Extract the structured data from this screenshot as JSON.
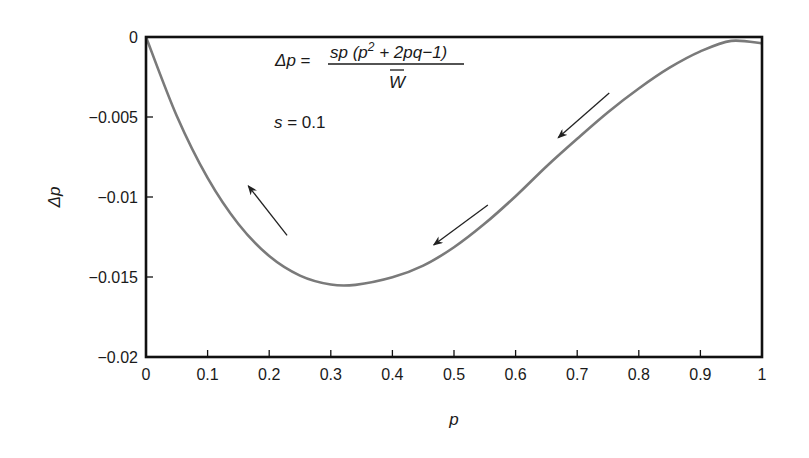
{
  "chart_data": {
    "type": "line",
    "title": "",
    "xlabel": "p",
    "ylabel": "Δp",
    "xlim": [
      0,
      1
    ],
    "ylim": [
      -0.02,
      0
    ],
    "grid": false,
    "x_ticks": [
      "0",
      "0.1",
      "0.2",
      "0.3",
      "0.4",
      "0.5",
      "0.6",
      "0.7",
      "0.8",
      "0.9",
      "1"
    ],
    "y_ticks": [
      "0",
      "−0.005",
      "−0.01",
      "−0.015",
      "−0.02"
    ],
    "series": [
      {
        "name": "Δp",
        "x": [
          0,
          0.05,
          0.1,
          0.15,
          0.2,
          0.25,
          0.3,
          0.34,
          0.4,
          0.45,
          0.5,
          0.55,
          0.6,
          0.65,
          0.7,
          0.75,
          0.8,
          0.85,
          0.9,
          0.95,
          1.0
        ],
        "y": [
          0,
          -0.00494,
          -0.00881,
          -0.01169,
          -0.01369,
          -0.01491,
          -0.01547,
          -0.01549,
          -0.01502,
          -0.01429,
          -0.01314,
          -0.01166,
          -0.00995,
          -0.00809,
          -0.00636,
          -0.0047,
          -0.00322,
          -0.00192,
          -0.0009,
          -0.00024,
          -0.0004
        ]
      }
    ],
    "annotations": {
      "equation_lhs": "Δp =",
      "equation_numerator": "sp (p² + 2pq−1)",
      "equation_denominator": "W̄",
      "parameter": "s = 0.1",
      "arrows": [
        {
          "from": [
            0.229,
            -0.0124
          ],
          "to": [
            0.166,
            -0.0093
          ],
          "direction": "up-left"
        },
        {
          "from": [
            0.555,
            -0.0105
          ],
          "to": [
            0.467,
            -0.013
          ],
          "direction": "down-left"
        },
        {
          "from": [
            0.752,
            -0.0035
          ],
          "to": [
            0.669,
            -0.0063
          ],
          "direction": "down-left"
        }
      ]
    },
    "colors": {
      "curve": "#7a7a7a",
      "axes": "#111111",
      "arrows": "#222222"
    }
  },
  "labels": {
    "x_axis_title": "p",
    "y_axis_title": "Δp",
    "eq_lhs_italic": "Δp",
    "eq_equals": " =",
    "eq_num": "sp (p",
    "eq_num_sup": "2",
    "eq_num_rest": " + 2pq−1)",
    "eq_den": "W",
    "param_s": "s",
    "param_rest": " = 0.1"
  }
}
